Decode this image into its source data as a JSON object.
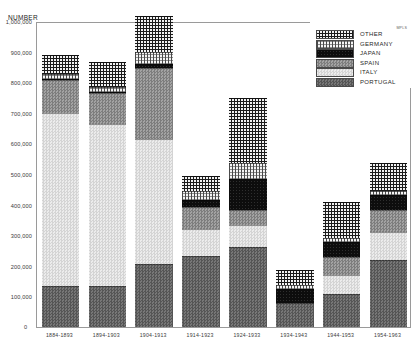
{
  "chart_data": {
    "type": "bar",
    "subtype": "stacked-bar",
    "title": "",
    "ylabel": "NUMBER",
    "xlabel": "",
    "ylim": [
      0,
      1000000
    ],
    "ytick_labels": [
      "1,000,000",
      "900,000",
      "800,000",
      "700,000",
      "600,000",
      "500,000",
      "400,000",
      "300,000",
      "200,000",
      "100,000",
      "0"
    ],
    "ytick_values": [
      1000000,
      900000,
      800000,
      700000,
      600000,
      500000,
      400000,
      300000,
      200000,
      100000,
      0
    ],
    "grid": false,
    "legend_position": "top-right",
    "categories": [
      "1884-1893",
      "1894-1903",
      "1904-1913",
      "1914-1923",
      "1924-1933",
      "1934-1943",
      "1944-1953",
      "1954-1963"
    ],
    "series": [
      {
        "name": "PORTUGAL",
        "values": [
          133000,
          135000,
          205000,
          233000,
          260000,
          77000,
          107000,
          220000
        ]
      },
      {
        "name": "ITALY",
        "values": [
          567000,
          530000,
          410000,
          87000,
          73000,
          0,
          63000,
          90000
        ]
      },
      {
        "name": "SPAIN",
        "values": [
          107000,
          100000,
          233000,
          73000,
          50000,
          0,
          60000,
          73000
        ]
      },
      {
        "name": "JAPAN",
        "values": [
          3000,
          3000,
          10000,
          23000,
          100000,
          47000,
          47000,
          47000
        ]
      },
      {
        "name": "GERMANY",
        "values": [
          17000,
          17000,
          40000,
          27000,
          53000,
          13000,
          13000,
          13000
        ]
      },
      {
        "name": "OTHER",
        "values": [
          63000,
          80000,
          120000,
          50000,
          213000,
          50000,
          117000,
          93000
        ]
      }
    ],
    "totals": [
      890000,
      865000,
      1018000,
      493000,
      749000,
      187000,
      407000,
      536000
    ],
    "stack_order_bottom_to_top": [
      "PORTUGAL",
      "ITALY",
      "SPAIN",
      "JAPAN",
      "GERMANY",
      "OTHER"
    ]
  },
  "axis": {
    "y_title": "NUMBER",
    "zero_label": "0"
  },
  "legend": {
    "items": [
      {
        "label": "OTHER",
        "pattern": "pat-other",
        "color": "#1b1b1b"
      },
      {
        "label": "GERMANY",
        "pattern": "pat-germany",
        "color": "#f4f4f4"
      },
      {
        "label": "JAPAN",
        "pattern": "pat-japan",
        "color": "#0d0d0d"
      },
      {
        "label": "SPAIN",
        "pattern": "pat-spain",
        "color": "#8f8f8f"
      },
      {
        "label": "ITALY",
        "pattern": "pat-italy",
        "color": "#dedede"
      },
      {
        "label": "PORTUGAL",
        "pattern": "pat-portugal",
        "color": "#626262"
      }
    ]
  },
  "marks": {
    "corner": "MPLS"
  }
}
